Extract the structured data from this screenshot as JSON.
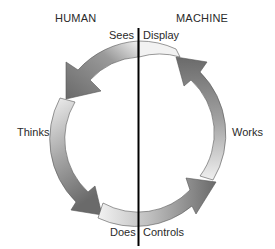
{
  "diagram": {
    "type": "cycle",
    "headers": {
      "left": "HUMAN",
      "right": "MACHINE"
    },
    "labels": {
      "top_left": "Sees",
      "top_right": "Display",
      "left": "Thinks",
      "right": "Works",
      "bottom_left": "Does",
      "bottom_right": "Controls"
    },
    "colors": {
      "arrow_dark": "#6e6e6e",
      "arrow_light": "#ececec",
      "outline": "#555555",
      "divider": "#000000"
    }
  }
}
